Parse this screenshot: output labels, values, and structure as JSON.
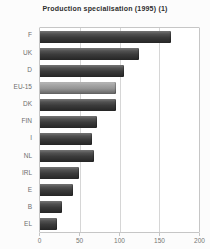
{
  "chart_data": {
    "type": "bar",
    "orientation": "horizontal",
    "title": "Production specialisation (1995) (1)",
    "xlabel": "",
    "ylabel": "",
    "categories": [
      "F",
      "UK",
      "D",
      "EU-15",
      "DK",
      "FIN",
      "I",
      "NL",
      "IRL",
      "E",
      "B",
      "EL"
    ],
    "values": [
      165,
      125,
      106,
      95,
      96,
      72,
      66,
      68,
      49,
      42,
      28,
      21
    ],
    "xlim": [
      0,
      200
    ],
    "xticks": [
      0,
      50,
      100,
      150,
      200
    ],
    "grid": "vertical",
    "legend": "none",
    "highlight_category": "EU-15",
    "colors": {
      "bar": "#3d3d3d",
      "highlight_bar": "#9c9c9c",
      "grid": "#d6d6d6",
      "axis": "#c6c6c6",
      "category_label": "#6e6e6e",
      "tick_label": "#757575",
      "title": "#2e2e2e",
      "background": "#fcfcfc",
      "plot_background": "#ffffff"
    }
  }
}
